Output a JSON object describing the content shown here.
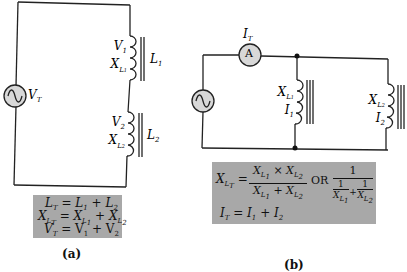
{
  "diagram_a": {
    "caption": "(a)",
    "source_label": "V",
    "source_label_sub": "T",
    "inductor1": {
      "v_label": "V",
      "v_sub": "1",
      "x_label": "X",
      "x_sub": "L",
      "x_sub2": "1",
      "l_label": "L",
      "l_sub": "1"
    },
    "inductor2": {
      "v_label": "V",
      "v_sub": "2",
      "x_label": "X",
      "x_sub": "L",
      "x_sub2": "2",
      "l_label": "L",
      "l_sub": "2"
    },
    "equations": [
      "L_T = L_1 + L_2",
      "X_LT = X_L1 + X_L2",
      "V_T = V_1 + V_2"
    ]
  },
  "diagram_b": {
    "caption": "(b)",
    "ammeter_label": "A",
    "ammeter_current_label": "I",
    "ammeter_current_sub": "T",
    "inductor1": {
      "x_label": "X",
      "x_sub": "L",
      "x_sub2": "1",
      "i_label": "I",
      "i_sub": "1"
    },
    "inductor2": {
      "x_label": "X",
      "x_sub": "L",
      "x_sub2": "2",
      "i_label": "I",
      "i_sub": "2"
    },
    "equations": {
      "reactance": "X_LT = (X_L1 × X_L2)/(X_L1 + X_L2) OR 1/(1/X_L1 + 1/X_L2)",
      "or_text": "OR",
      "current": "I_T = I_1 + I_2"
    }
  },
  "colors": {
    "wire": "#222222",
    "box_fill": "#a8a8a8",
    "source_fill": "#d8d8d8"
  }
}
